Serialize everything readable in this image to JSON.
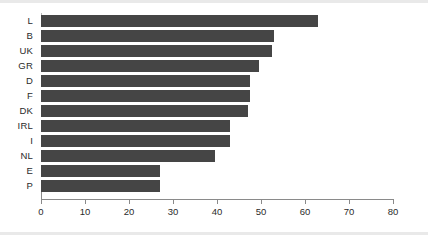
{
  "chart_data": {
    "type": "bar",
    "orientation": "horizontal",
    "title": "",
    "subtitle": "",
    "xlabel": "",
    "ylabel": "",
    "categories": [
      "L",
      "B",
      "UK",
      "GR",
      "D",
      "F",
      "DK",
      "IRL",
      "I",
      "NL",
      "E",
      "P"
    ],
    "values": [
      63,
      53,
      52.5,
      49.5,
      47.5,
      47.5,
      47,
      43,
      43,
      39.5,
      27,
      27
    ],
    "series": [
      {
        "name": "",
        "values": [
          63,
          53,
          52.5,
          49.5,
          47.5,
          47.5,
          47,
          43,
          43,
          39.5,
          27,
          27
        ]
      }
    ],
    "xlim": [
      0,
      80
    ],
    "xticks": [
      0,
      10,
      20,
      30,
      40,
      50,
      60,
      70,
      80
    ],
    "xtick_labels": [
      "0",
      "10",
      "20",
      "30",
      "40",
      "50",
      "60",
      "70",
      "80"
    ],
    "grid": false,
    "legend": null,
    "legend_position": "none",
    "bar_color": "#454545",
    "axis_color": "#8a8a8a",
    "background_color": "#ffffff",
    "frame_color": "#e9e9e9",
    "annotations": []
  }
}
